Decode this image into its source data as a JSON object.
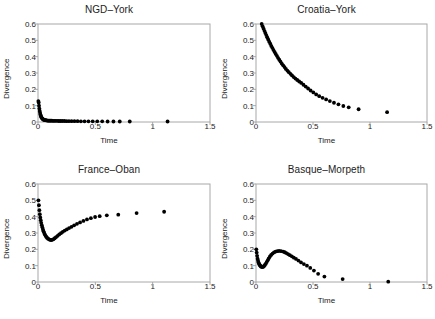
{
  "figure": {
    "axis_labels": {
      "x": "Time",
      "y": "Divergence"
    },
    "frame_color": "#a8a8a8",
    "marker_color": "#000000"
  },
  "chart_data": [
    {
      "type": "scatter",
      "title": "NGD–York",
      "xlabel": "Time",
      "ylabel": "Divergence",
      "xlim": [
        0,
        1.5
      ],
      "ylim": [
        0,
        0.6
      ],
      "xticks": [
        0,
        0.5,
        1,
        1.5
      ],
      "xticklabels": [
        "0",
        "0.5",
        "1",
        "1.5"
      ],
      "yticks": [
        0,
        0.1,
        0.2,
        0.3,
        0.4,
        0.5,
        0.6
      ],
      "yticklabels": [
        "0",
        "0.1",
        "0.2",
        "0.3",
        "0.4",
        "0.5",
        "0.6"
      ],
      "grid": false,
      "legend": "none",
      "x": [
        0.003,
        0.006,
        0.009,
        0.012,
        0.015,
        0.018,
        0.021,
        0.024,
        0.027,
        0.03,
        0.034,
        0.038,
        0.042,
        0.046,
        0.05,
        0.055,
        0.06,
        0.065,
        0.07,
        0.076,
        0.082,
        0.089,
        0.096,
        0.104,
        0.112,
        0.121,
        0.131,
        0.142,
        0.154,
        0.167,
        0.181,
        0.196,
        0.212,
        0.23,
        0.249,
        0.27,
        0.293,
        0.318,
        0.345,
        0.374,
        0.406,
        0.44,
        0.477,
        0.517,
        0.56,
        0.607,
        0.658,
        0.713,
        0.8,
        1.13
      ],
      "y": [
        0.128,
        0.12,
        0.1,
        0.082,
        0.068,
        0.056,
        0.046,
        0.039,
        0.033,
        0.028,
        0.024,
        0.021,
        0.018,
        0.016,
        0.014,
        0.013,
        0.012,
        0.011,
        0.01,
        0.01,
        0.009,
        0.009,
        0.008,
        0.008,
        0.008,
        0.008,
        0.007,
        0.007,
        0.007,
        0.007,
        0.006,
        0.006,
        0.006,
        0.006,
        0.005,
        0.005,
        0.005,
        0.005,
        0.005,
        0.004,
        0.004,
        0.004,
        0.004,
        0.004,
        0.004,
        0.003,
        0.003,
        0.003,
        0.003,
        0.003
      ]
    },
    {
      "type": "scatter",
      "title": "Croatia–York",
      "xlabel": "Time",
      "ylabel": "Divergence",
      "xlim": [
        0,
        1.5
      ],
      "ylim": [
        0,
        0.6
      ],
      "xticks": [
        0,
        0.5,
        1,
        1.5
      ],
      "xticklabels": [
        "0",
        "0.5",
        "1",
        "1.5"
      ],
      "yticks": [
        0,
        0.1,
        0.2,
        0.3,
        0.4,
        0.5,
        0.6
      ],
      "yticklabels": [
        "0",
        "0.1",
        "0.2",
        "0.3",
        "0.4",
        "0.5",
        "0.6"
      ],
      "grid": false,
      "legend": "none",
      "x": [
        0.05,
        0.058,
        0.066,
        0.074,
        0.082,
        0.09,
        0.098,
        0.107,
        0.116,
        0.125,
        0.134,
        0.143,
        0.153,
        0.163,
        0.173,
        0.183,
        0.193,
        0.204,
        0.215,
        0.226,
        0.238,
        0.25,
        0.262,
        0.275,
        0.288,
        0.302,
        0.316,
        0.331,
        0.346,
        0.362,
        0.379,
        0.397,
        0.416,
        0.436,
        0.457,
        0.479,
        0.503,
        0.528,
        0.555,
        0.584,
        0.615,
        0.648,
        0.684,
        0.723,
        0.766,
        0.813,
        0.9,
        1.15
      ],
      "y": [
        0.6,
        0.586,
        0.572,
        0.558,
        0.545,
        0.532,
        0.519,
        0.505,
        0.492,
        0.479,
        0.466,
        0.454,
        0.441,
        0.429,
        0.417,
        0.405,
        0.393,
        0.381,
        0.37,
        0.358,
        0.347,
        0.336,
        0.325,
        0.315,
        0.305,
        0.295,
        0.285,
        0.275,
        0.266,
        0.257,
        0.248,
        0.239,
        0.228,
        0.217,
        0.205,
        0.193,
        0.181,
        0.169,
        0.158,
        0.148,
        0.138,
        0.128,
        0.118,
        0.108,
        0.098,
        0.09,
        0.078,
        0.06,
        0.042
      ]
    },
    {
      "type": "scatter",
      "title": "France–Oban",
      "xlabel": "Time",
      "ylabel": "Divergence",
      "xlim": [
        0,
        1.5
      ],
      "ylim": [
        0,
        0.6
      ],
      "xticks": [
        0,
        0.5,
        1,
        1.5
      ],
      "xticklabels": [
        "0",
        "0.5",
        "1",
        "1.5"
      ],
      "yticks": [
        0,
        0.1,
        0.2,
        0.3,
        0.4,
        0.5,
        0.6
      ],
      "yticklabels": [
        "0",
        "0.1",
        "0.2",
        "0.3",
        "0.4",
        "0.5",
        "0.6"
      ],
      "grid": false,
      "legend": "none",
      "x": [
        0.004,
        0.008,
        0.012,
        0.016,
        0.02,
        0.024,
        0.028,
        0.033,
        0.038,
        0.043,
        0.048,
        0.054,
        0.06,
        0.066,
        0.073,
        0.08,
        0.088,
        0.096,
        0.105,
        0.114,
        0.124,
        0.135,
        0.146,
        0.158,
        0.171,
        0.185,
        0.2,
        0.216,
        0.233,
        0.251,
        0.271,
        0.292,
        0.315,
        0.34,
        0.367,
        0.396,
        0.427,
        0.461,
        0.498,
        0.538,
        0.6,
        0.7,
        0.86,
        1.1
      ],
      "y": [
        0.5,
        0.47,
        0.44,
        0.415,
        0.395,
        0.378,
        0.362,
        0.348,
        0.335,
        0.322,
        0.31,
        0.3,
        0.291,
        0.283,
        0.276,
        0.27,
        0.265,
        0.261,
        0.258,
        0.257,
        0.258,
        0.262,
        0.268,
        0.275,
        0.283,
        0.291,
        0.299,
        0.307,
        0.315,
        0.322,
        0.33,
        0.338,
        0.347,
        0.356,
        0.365,
        0.374,
        0.383,
        0.391,
        0.398,
        0.403,
        0.408,
        0.412,
        0.422,
        0.43
      ]
    },
    {
      "type": "scatter",
      "title": "Basque–Morpeth",
      "xlabel": "Time",
      "ylabel": "Divergence",
      "xlim": [
        0,
        1.5
      ],
      "ylim": [
        0,
        0.6
      ],
      "xticks": [
        0,
        0.5,
        1,
        1.5
      ],
      "xticklabels": [
        "0",
        "0.5",
        "1",
        "1.5"
      ],
      "yticks": [
        0,
        0.1,
        0.2,
        0.3,
        0.4,
        0.5,
        0.6
      ],
      "yticklabels": [
        "0",
        "0.1",
        "0.2",
        "0.3",
        "0.4",
        "0.5",
        "0.6"
      ],
      "grid": false,
      "legend": "none",
      "x": [
        0.003,
        0.006,
        0.01,
        0.014,
        0.018,
        0.022,
        0.026,
        0.031,
        0.036,
        0.041,
        0.046,
        0.052,
        0.058,
        0.064,
        0.071,
        0.078,
        0.086,
        0.094,
        0.103,
        0.112,
        0.122,
        0.133,
        0.145,
        0.158,
        0.172,
        0.187,
        0.203,
        0.22,
        0.238,
        0.252,
        0.266,
        0.281,
        0.297,
        0.314,
        0.332,
        0.351,
        0.372,
        0.395,
        0.42,
        0.447,
        0.476,
        0.508,
        0.545,
        0.6,
        0.76,
        1.16
      ],
      "y": [
        0.2,
        0.18,
        0.16,
        0.143,
        0.13,
        0.12,
        0.112,
        0.106,
        0.101,
        0.097,
        0.094,
        0.092,
        0.092,
        0.094,
        0.098,
        0.104,
        0.112,
        0.122,
        0.133,
        0.145,
        0.156,
        0.166,
        0.174,
        0.181,
        0.186,
        0.189,
        0.19,
        0.189,
        0.186,
        0.182,
        0.177,
        0.171,
        0.164,
        0.157,
        0.149,
        0.141,
        0.131,
        0.12,
        0.11,
        0.1,
        0.086,
        0.07,
        0.05,
        0.033,
        0.018,
        0.002
      ]
    }
  ]
}
